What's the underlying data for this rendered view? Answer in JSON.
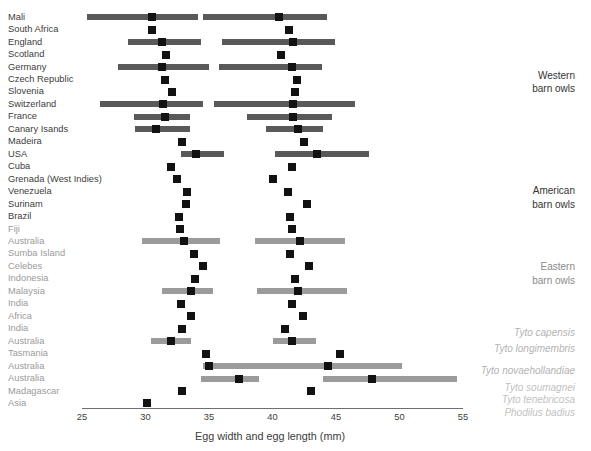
{
  "chart_data": {
    "type": "bar",
    "title": "",
    "xlabel": "Egg width and egg length (mm)",
    "ylabel": "",
    "xlim": [
      25,
      55
    ],
    "xticks": [
      25,
      30,
      35,
      40,
      45,
      50,
      55
    ],
    "grid": false,
    "legend": null,
    "series": [
      {
        "name": "Egg width (mm)",
        "role": "width"
      },
      {
        "name": "Egg length (mm)",
        "role": "length"
      }
    ],
    "colors": {
      "bar_dark": "#595959",
      "bar_light": "#9b9b9b",
      "marker": "#121212",
      "axis": "#6f6f6f",
      "text": "#3c3c3c"
    },
    "rows": [
      {
        "label": "Mali",
        "shade": "dark",
        "width_mean": 30.5,
        "width_min": 25.4,
        "width_max": 34.1,
        "length_mean": 40.5,
        "length_min": 34.5,
        "length_max": 44.3
      },
      {
        "label": "South Africa",
        "shade": "dark",
        "width_mean": 30.5,
        "width_min": null,
        "width_max": null,
        "length_mean": 41.3,
        "length_min": null,
        "length_max": null
      },
      {
        "label": "England",
        "shade": "dark",
        "width_mean": 31.3,
        "width_min": 28.6,
        "width_max": 34.4,
        "length_mean": 41.6,
        "length_min": 36.0,
        "length_max": 44.9
      },
      {
        "label": "Scotland",
        "shade": "dark",
        "width_mean": 31.6,
        "width_min": null,
        "width_max": null,
        "length_mean": 40.7,
        "length_min": null,
        "length_max": null
      },
      {
        "label": "Germany",
        "shade": "dark",
        "width_mean": 31.3,
        "width_min": 27.8,
        "width_max": 35.0,
        "length_mean": 41.5,
        "length_min": 35.8,
        "length_max": 43.9
      },
      {
        "label": "Czech Republic",
        "shade": "dark",
        "width_mean": 31.5,
        "width_min": null,
        "width_max": null,
        "length_mean": 41.9,
        "length_min": null,
        "length_max": null
      },
      {
        "label": "Slovenia",
        "shade": "dark",
        "width_mean": 32.1,
        "width_min": null,
        "width_max": null,
        "length_mean": 41.8,
        "length_min": null,
        "length_max": null
      },
      {
        "label": "Switzerland",
        "shade": "dark",
        "width_mean": 31.4,
        "width_min": 26.4,
        "width_max": 34.5,
        "length_mean": 41.6,
        "length_min": 35.4,
        "length_max": 46.5
      },
      {
        "label": "France",
        "shade": "dark",
        "width_mean": 31.5,
        "width_min": 29.1,
        "width_max": 33.5,
        "length_mean": 41.6,
        "length_min": 38.0,
        "length_max": 44.7
      },
      {
        "label": "Canary Isands",
        "shade": "dark",
        "width_mean": 30.8,
        "width_min": 29.2,
        "width_max": 33.5,
        "length_mean": 42.0,
        "length_min": 39.5,
        "length_max": 44.0
      },
      {
        "label": "Madeira",
        "shade": "dark",
        "width_mean": 32.9,
        "width_min": null,
        "width_max": null,
        "length_mean": 42.5,
        "length_min": null,
        "length_max": null
      },
      {
        "label": "USA",
        "shade": "dark",
        "width_mean": 34.0,
        "width_min": 32.8,
        "width_max": 36.2,
        "length_mean": 43.5,
        "length_min": 40.2,
        "length_max": 47.6
      },
      {
        "label": "Cuba",
        "shade": "dark",
        "width_mean": 32.0,
        "width_min": null,
        "width_max": null,
        "length_mean": 41.5,
        "length_min": null,
        "length_max": null
      },
      {
        "label": "Grenada (West Indies)",
        "shade": "dark",
        "width_mean": 32.5,
        "width_min": null,
        "width_max": null,
        "length_mean": 40.0,
        "length_min": null,
        "length_max": null
      },
      {
        "label": "Venezuela",
        "shade": "dark",
        "width_mean": 33.3,
        "width_min": null,
        "width_max": null,
        "length_mean": 41.2,
        "length_min": null,
        "length_max": null
      },
      {
        "label": "Surinam",
        "shade": "dark",
        "width_mean": 33.2,
        "width_min": null,
        "width_max": null,
        "length_mean": 42.7,
        "length_min": null,
        "length_max": null
      },
      {
        "label": "Brazil",
        "shade": "dark",
        "width_mean": 32.6,
        "width_min": null,
        "width_max": null,
        "length_mean": 41.4,
        "length_min": null,
        "length_max": null
      },
      {
        "label": "Fiji",
        "shade": "light",
        "width_mean": 32.7,
        "width_min": null,
        "width_max": null,
        "length_mean": 41.5,
        "length_min": null,
        "length_max": null
      },
      {
        "label": "Australia",
        "shade": "light",
        "width_mean": 33.0,
        "width_min": 29.7,
        "width_max": 35.9,
        "length_mean": 42.2,
        "length_min": 38.6,
        "length_max": 45.7
      },
      {
        "label": "Sumba Island",
        "shade": "light",
        "width_mean": 33.8,
        "width_min": null,
        "width_max": null,
        "length_mean": 41.4,
        "length_min": null,
        "length_max": null
      },
      {
        "label": "Celebes",
        "shade": "light",
        "width_mean": 34.5,
        "width_min": null,
        "width_max": null,
        "length_mean": 42.9,
        "length_min": null,
        "length_max": null
      },
      {
        "label": "Indonesia",
        "shade": "light",
        "width_mean": 33.9,
        "width_min": null,
        "width_max": null,
        "length_mean": 41.8,
        "length_min": null,
        "length_max": null
      },
      {
        "label": "Malaysia",
        "shade": "light",
        "width_mean": 33.6,
        "width_min": 31.3,
        "width_max": 35.3,
        "length_mean": 42.0,
        "length_min": 38.8,
        "length_max": 45.9
      },
      {
        "label": "India",
        "shade": "light",
        "width_mean": 32.8,
        "width_min": null,
        "width_max": null,
        "length_mean": 41.5,
        "length_min": null,
        "length_max": null
      },
      {
        "label": "Africa",
        "shade": "light",
        "width_mean": 33.6,
        "width_min": null,
        "width_max": null,
        "length_mean": 42.4,
        "length_min": null,
        "length_max": null
      },
      {
        "label": "India",
        "shade": "light",
        "width_mean": 32.9,
        "width_min": null,
        "width_max": null,
        "length_mean": 41.0,
        "length_min": null,
        "length_max": null
      },
      {
        "label": "Australia",
        "shade": "light",
        "width_mean": 32.0,
        "width_min": 30.4,
        "width_max": 33.6,
        "length_mean": 41.5,
        "length_min": 40.0,
        "length_max": 43.4
      },
      {
        "label": "Tasmania",
        "shade": "light",
        "width_mean": 34.8,
        "width_min": null,
        "width_max": null,
        "length_mean": 45.3,
        "length_min": null,
        "length_max": null
      },
      {
        "label": "Australia",
        "shade": "light",
        "width_mean": 35.0,
        "width_min": 34.5,
        "width_max": 39.5,
        "length_mean": 44.4,
        "length_min": 39.4,
        "length_max": 50.2
      },
      {
        "label": "Australia",
        "shade": "light",
        "width_mean": 37.4,
        "width_min": 34.4,
        "width_max": 38.9,
        "length_mean": 47.8,
        "length_min": 44.0,
        "length_max": 54.5
      },
      {
        "label": "Madagascar",
        "shade": "light",
        "width_mean": 32.9,
        "width_min": null,
        "width_max": null,
        "length_mean": 43.0,
        "length_min": null,
        "length_max": null
      },
      {
        "label": "Asia",
        "shade": "light",
        "width_mean": 30.1,
        "width_min": null,
        "width_max": null,
        "length_mean": null,
        "length_min": null,
        "length_max": null
      }
    ],
    "annotations": [
      {
        "text": "Western\nbarn owls",
        "style": "dark",
        "row_anchor": 5.0,
        "name": "western-barn-owls"
      },
      {
        "text": "American\nbarn owls",
        "style": "dark",
        "row_anchor": 14.3,
        "name": "american-barn-owls"
      },
      {
        "text": "Eastern\nbarn owls",
        "style": "mid",
        "row_anchor": 20.4,
        "name": "eastern-barn-owls"
      },
      {
        "text": "Tyto capensis",
        "style": "light",
        "row_anchor": 25.2,
        "name": "tyto-capensis"
      },
      {
        "text": "Tyto longimembris",
        "style": "light",
        "row_anchor": 26.5,
        "name": "tyto-longimembris"
      },
      {
        "text": "Tyto novaehollandiae",
        "style": "light",
        "row_anchor": 28.2,
        "name": "tyto-novaehollandiae"
      },
      {
        "text": "Tyto soumagnei",
        "style": "light2",
        "row_anchor": 29.6,
        "name": "tyto-soumagnei"
      },
      {
        "text": "Tyto tenebricosa",
        "style": "light2",
        "row_anchor": 30.6,
        "name": "tyto-tenebricosa"
      },
      {
        "text": "Phodilus badius",
        "style": "light2",
        "row_anchor": 31.6,
        "name": "phodilus-badius"
      }
    ]
  }
}
